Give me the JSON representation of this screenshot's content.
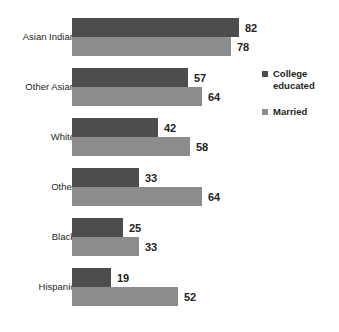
{
  "chart_data": {
    "type": "bar",
    "orientation": "horizontal",
    "title": "",
    "subtitle": "",
    "xlabel": "",
    "ylabel": "",
    "grid": false,
    "xlim": [
      0,
      82
    ],
    "legend_position": "right",
    "categories": [
      "Asian Indian",
      "Other Asian",
      "White",
      "Other",
      "Black",
      "Hispanic"
    ],
    "series": [
      {
        "name": "College educated",
        "color": "#4d4d4d",
        "values": [
          82,
          57,
          42,
          33,
          25,
          19
        ]
      },
      {
        "name": "Married",
        "color": "#8c8c8c",
        "values": [
          78,
          64,
          58,
          64,
          33,
          52
        ]
      }
    ],
    "value_labels": [
      [
        "82",
        "78"
      ],
      [
        "57",
        "64"
      ],
      [
        "42",
        "58"
      ],
      [
        "33",
        "64"
      ],
      [
        "25",
        "33"
      ],
      [
        "19",
        "52"
      ]
    ]
  },
  "legend": {
    "items": [
      {
        "label": "College educated",
        "color": "#4d4d4d"
      },
      {
        "label": "Married",
        "color": "#8c8c8c"
      }
    ]
  },
  "colors": {
    "background": "#ffffff",
    "text": "#231f20",
    "series_college_educated": "#4d4d4d",
    "series_married": "#8c8c8c"
  }
}
